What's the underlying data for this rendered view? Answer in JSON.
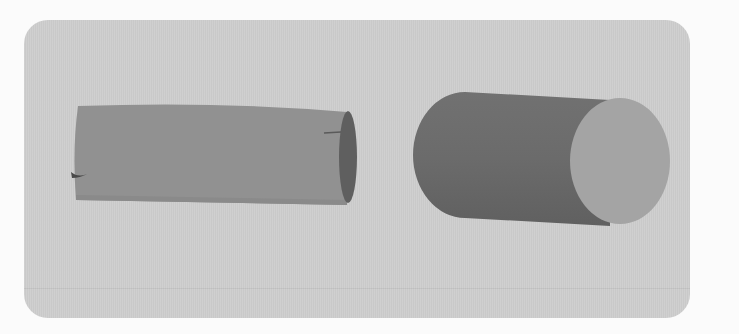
{
  "scene": {
    "description": "Two grey cylinders lying horizontally on a rounded light-grey panel",
    "background_color": "#fbfbfb",
    "panel_color": "#cdcdcd",
    "objects": [
      {
        "name": "left-cylinder",
        "style": "flat shaded, open/hollow right end",
        "body_color": "#8f8f8f",
        "end_color": "#5e5e5e"
      },
      {
        "name": "right-cylinder",
        "style": "solid shaded with visible circular cap",
        "body_color": "#6a6a6a",
        "cap_color": "#a3a3a3"
      }
    ]
  }
}
